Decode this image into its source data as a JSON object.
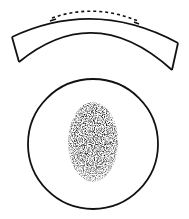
{
  "diagram": {
    "background": "#ffffff",
    "stroke_color": "#111111",
    "lens_section": {
      "description": "curved lens cross-section with dashed outline along top surface",
      "outer_arc": "M12 37 Q95 -2 178 43",
      "inner_arc": "M19 62 Q95 -2 172 70",
      "dashed_arc": "M52 18 Q95 2 138 20"
    },
    "top_view": {
      "circle": {
        "cx": 93,
        "cy": 144,
        "r": 65
      },
      "stippled_oval": {
        "cx": 93,
        "cy": 142,
        "rx": 25,
        "ry": 40,
        "fill": "#1a1a1a"
      }
    }
  }
}
